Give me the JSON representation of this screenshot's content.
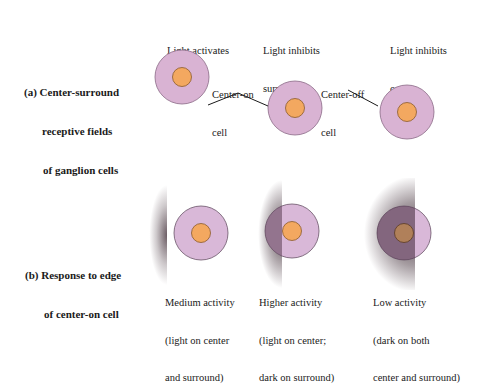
{
  "column_headers": [
    {
      "line1": "Light activates",
      "line2": "center"
    },
    {
      "line1": "Light inhibits",
      "line2": "surround"
    },
    {
      "line1": "Light inhibits",
      "line2": "center"
    }
  ],
  "panel_a": {
    "label_line1": "(a) Center-surround",
    "label_line2": "receptive fields",
    "label_line3": "of ganglion cells",
    "center_on_label": {
      "line1": "Center-on",
      "line2": "cell"
    },
    "center_off_label": {
      "line1": "Center-off",
      "line2": "cell"
    }
  },
  "panel_b": {
    "label_line1": "(b) Response to edge",
    "label_line2": "of center-on cell",
    "captions": [
      {
        "line1": "Medium activity",
        "line2": "(light on center",
        "line3": "and surround)"
      },
      {
        "line1": "Higher activity",
        "line2": "(light on center;",
        "line3": "dark on surround)"
      },
      {
        "line1": "Low activity",
        "line2": "(dark on both",
        "line3": "center and surround)"
      }
    ]
  },
  "colors": {
    "surround_fill": "#d9b3d3",
    "surround_stroke": "#8a6a86",
    "center_fill": "#f3a860",
    "center_stroke": "#8a5a2a",
    "shadow": "#3a2630"
  }
}
